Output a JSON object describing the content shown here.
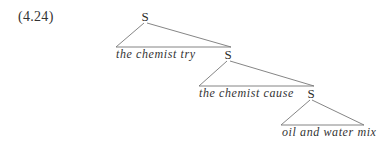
{
  "example": {
    "number": "(4.24)"
  },
  "tree": {
    "nodes": [
      {
        "label": "S",
        "leaf": "the chemist try"
      },
      {
        "label": "S",
        "leaf": "the chemist cause"
      },
      {
        "label": "S",
        "leaf": "oil and water mix"
      }
    ]
  }
}
